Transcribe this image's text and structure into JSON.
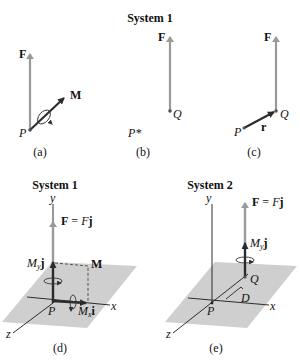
{
  "colors": {
    "force_arrow": "#9a9a9a",
    "moment_arrow": "#2b2b2b",
    "axis": "#1a1a1a",
    "plane": "#cfcfcf",
    "text": "#111111"
  },
  "top_row": {
    "title": "System 1",
    "panel_a": {
      "caption": "(a)",
      "force_label": "F",
      "moment_label": "M",
      "point_label": "P"
    },
    "panel_b": {
      "caption": "(b)",
      "point_label": "P*",
      "force_label": "F",
      "q_label": "Q"
    },
    "panel_c": {
      "caption": "(c)",
      "force_label": "F",
      "q_label": "Q",
      "p_label": "P",
      "r_label": "r"
    }
  },
  "panel_d": {
    "title": "System 1",
    "caption": "(d)",
    "axis_y": "y",
    "axis_x": "x",
    "axis_z": "z",
    "force_label_bold": "F",
    "force_label_eq": " = ",
    "force_label_scalar": "F",
    "force_label_unit": "j",
    "my_label_M": "M",
    "my_label_sub": "y",
    "my_label_unit": "j",
    "moment_label": "M",
    "mx_label_M": "M",
    "mx_label_sub": "x",
    "mx_label_unit": "i",
    "point_label": "P"
  },
  "panel_e": {
    "title": "System 2",
    "caption": "(e)",
    "axis_y": "y",
    "axis_x": "x",
    "axis_z": "z",
    "force_label_bold": "F",
    "force_label_eq": " = ",
    "force_label_scalar": "F",
    "force_label_unit": "j",
    "my_label_M": "M",
    "my_label_sub": "y",
    "my_label_unit": "j",
    "q_label": "Q",
    "distance_label": "D",
    "point_label": "P"
  }
}
